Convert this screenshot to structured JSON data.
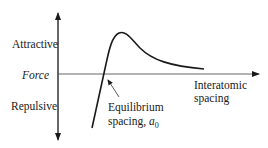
{
  "diagram": {
    "y_axis": {
      "label": "Force",
      "positive_label": "Attractive",
      "negative_label": "Repulsive"
    },
    "x_axis": {
      "label_line1": "Interatomic",
      "label_line2": "spacing"
    },
    "annotation": {
      "line1": "Equilibrium",
      "line2_prefix": "spacing, ",
      "symbol": "a",
      "subscript": "0"
    },
    "curve_color": "#1a1a1a"
  }
}
